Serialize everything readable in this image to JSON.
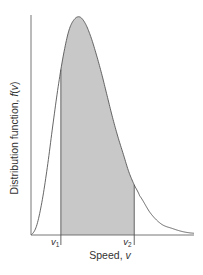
{
  "chart_data": {
    "type": "area",
    "title": "",
    "xlabel": "Speed, v",
    "ylabel": "Distribution function, f(v)",
    "ylabel_parts": {
      "prefix": "Distribution function, ",
      "func": "f",
      "open": "(",
      "var": "v",
      "close": ")"
    },
    "xlabel_parts": {
      "prefix": "Speed, ",
      "var": "v"
    },
    "grid": false,
    "legend": null,
    "x": [
      0,
      0.1,
      0.2,
      0.3,
      0.4,
      0.5,
      0.6,
      0.7,
      0.8,
      0.9,
      1.0,
      1.1,
      1.2,
      1.3,
      1.4,
      1.5,
      1.6,
      1.7,
      1.8,
      1.9,
      2.0,
      2.2,
      2.4,
      2.6,
      2.8,
      3.0
    ],
    "series": [
      {
        "name": "f(v)",
        "values": [
          0,
          0.04,
          0.15,
          0.31,
          0.5,
          0.68,
          0.83,
          0.94,
          0.99,
          1.0,
          0.97,
          0.91,
          0.83,
          0.74,
          0.64,
          0.54,
          0.45,
          0.37,
          0.29,
          0.23,
          0.18,
          0.1,
          0.05,
          0.03,
          0.015,
          0.008
        ]
      }
    ],
    "shaded_region": {
      "from_label": "v1",
      "to_label": "v2",
      "from": 0.55,
      "to": 1.9,
      "color": "#c8c8c8"
    },
    "annotations": [
      {
        "label": "v",
        "subscript": "1",
        "x": 0.55
      },
      {
        "label": "v",
        "subscript": "2",
        "x": 1.9
      }
    ],
    "xlim": [
      0,
      3.0
    ],
    "ylim": [
      0,
      1.0
    ],
    "ticks_shown": false
  },
  "labels": {
    "v1": {
      "var": "v",
      "sub": "1"
    },
    "v2": {
      "var": "v",
      "sub": "2"
    }
  },
  "colors": {
    "axis": "#555555",
    "curve": "#555555",
    "fill": "#c8c8c8"
  }
}
